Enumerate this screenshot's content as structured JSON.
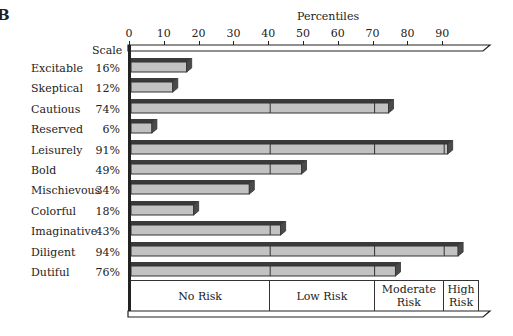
{
  "figure_letter": "B",
  "chart_data": {
    "type": "bar",
    "orientation": "horizontal",
    "title": "",
    "xlabel": "Percentiles",
    "ylabel": "Scale",
    "xlim": [
      0,
      100
    ],
    "x_ticks": [
      0,
      10,
      20,
      30,
      40,
      50,
      60,
      70,
      80,
      90
    ],
    "categories": [
      "Excitable",
      "Skeptical",
      "Cautious",
      "Reserved",
      "Leisurely",
      "Bold",
      "Mischievous",
      "Colorful",
      "Imaginative",
      "Diligent",
      "Dutiful"
    ],
    "values": [
      16,
      12,
      74,
      6,
      91,
      49,
      34,
      18,
      43,
      94,
      76
    ],
    "value_labels": [
      "16%",
      "12%",
      "74%",
      "6%",
      "91%",
      "49%",
      "34%",
      "18%",
      "43%",
      "94%",
      "76%"
    ],
    "zones": [
      {
        "label": "No Risk",
        "from": 0,
        "to": 40
      },
      {
        "label": "Low Risk",
        "from": 40,
        "to": 70
      },
      {
        "label": "Moderate Risk",
        "from": 70,
        "to": 90
      },
      {
        "label": "High Risk",
        "from": 90,
        "to": 100
      }
    ],
    "grid": false,
    "legend": null
  },
  "axis": {
    "title": "Percentiles",
    "scale_header": "Scale"
  },
  "colors": {
    "bar_face": "#c2c2c2",
    "bar_top": "#3a3a3a",
    "line": "#222222"
  }
}
